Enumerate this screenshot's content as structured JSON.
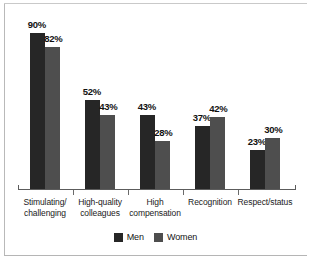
{
  "chart_data": {
    "type": "bar",
    "title": "",
    "subtitle": "",
    "xlabel": "",
    "ylabel": "",
    "ylim": [
      0,
      100
    ],
    "grid": false,
    "legend_position": "bottom-center",
    "value_suffix": "%",
    "categories": [
      "Stimulating/\nchallenging",
      "High-quality\ncolleagues",
      "High\ncompensation",
      "Recognition",
      "Respect/status"
    ],
    "series": [
      {
        "name": "Men",
        "color": "#262626",
        "values": [
          90,
          52,
          43,
          37,
          23
        ],
        "labels": [
          "90%",
          "52%",
          "43%",
          "37%",
          "23%"
        ]
      },
      {
        "name": "Women",
        "color": "#4e4e4e",
        "values": [
          82,
          43,
          28,
          42,
          30
        ],
        "labels": [
          "82%",
          "43%",
          "28%",
          "42%",
          "30%"
        ]
      }
    ]
  },
  "legend": {
    "items": [
      {
        "label": "Men"
      },
      {
        "label": "Women"
      }
    ]
  },
  "colors": {
    "men": "#262626",
    "women": "#4e4e4e",
    "axis": "#5c5c5c",
    "frame": "#b9b9b9",
    "background": "#ffffff",
    "text": "#141414"
  }
}
